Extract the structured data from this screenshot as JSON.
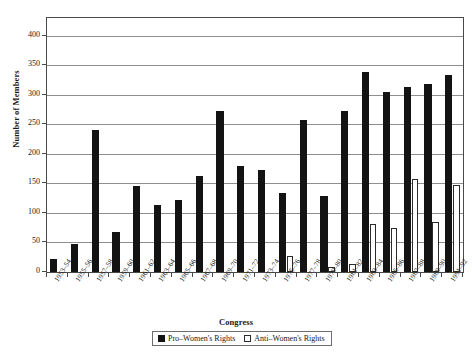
{
  "chart_data": {
    "type": "bar",
    "title": "",
    "xlabel": "Congress",
    "ylabel": "Number of Members",
    "ylim": [
      0,
      430
    ],
    "yticks": [
      0,
      50,
      100,
      150,
      200,
      250,
      300,
      350,
      400
    ],
    "grid": true,
    "legend_position": "bottom",
    "categories": [
      "1953–54",
      "1955–56",
      "1957–58",
      "1959–60",
      "1961–62",
      "1963–64",
      "1965–66",
      "1967–68",
      "1969–70",
      "1971–72",
      "1973–74",
      "1975–76",
      "1977–78",
      "1979–80",
      "1981–82",
      "1983–84",
      "1985–86",
      "1987–88",
      "1989–90",
      "1991–92"
    ],
    "series": [
      {
        "name": "Pro–Women's Rights",
        "color": "#131313",
        "values": [
          22,
          48,
          240,
          68,
          146,
          114,
          122,
          163,
          272,
          180,
          172,
          133,
          257,
          128,
          272,
          338,
          305,
          313,
          318,
          333
        ]
      },
      {
        "name": "Anti–Women's Rights",
        "color": "#ffffff",
        "values": [
          0,
          0,
          0,
          0,
          0,
          0,
          0,
          0,
          0,
          0,
          0,
          27,
          0,
          8,
          13,
          82,
          74,
          158,
          84,
          148
        ]
      }
    ]
  },
  "legend": {
    "items": [
      {
        "label": "Pro–Women's Rights",
        "swatch": "filled-square-icon"
      },
      {
        "label": "Anti–Women's Rights",
        "swatch": "open-square-icon"
      }
    ]
  }
}
